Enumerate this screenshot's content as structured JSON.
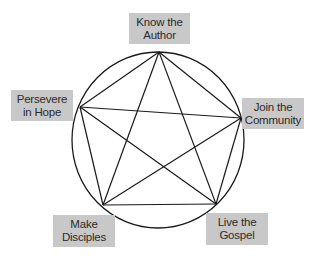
{
  "diagram": {
    "type": "pentagram-in-circle",
    "circle": {
      "cx": 158,
      "cy": 140,
      "rx": 86,
      "ry": 88,
      "stroke": "#1a1a1a"
    },
    "colors": {
      "label_bg": "#c8c8c8",
      "label_text": "#2b2b2b",
      "line": "#1a1a1a",
      "background": "#ffffff"
    },
    "nodes": [
      {
        "id": "top",
        "line1": "Know the",
        "line2": "Author",
        "x": 159,
        "y": 52
      },
      {
        "id": "right",
        "line1": "Join the",
        "line2": "Community",
        "x": 241,
        "y": 118
      },
      {
        "id": "bottom-right",
        "line1": "Live the",
        "line2": "Gospel",
        "x": 216,
        "y": 204
      },
      {
        "id": "bottom-left",
        "line1": "Make",
        "line2": "Disciples",
        "x": 103,
        "y": 205
      },
      {
        "id": "left",
        "line1": "Persevere",
        "line2": "in Hope",
        "x": 80,
        "y": 107
      }
    ]
  }
}
